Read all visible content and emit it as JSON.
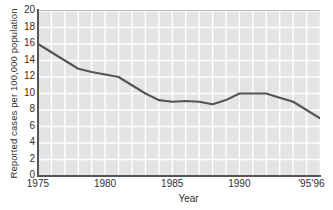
{
  "chart_data": {
    "type": "line",
    "title": "",
    "xlabel": "Year",
    "ylabel": "Reported cases per 100,000 population",
    "xlim": [
      1975,
      1996
    ],
    "ylim": [
      0,
      20
    ],
    "ytick_values": [
      0,
      2,
      4,
      6,
      8,
      10,
      12,
      14,
      16,
      18,
      20
    ],
    "ytick_labels": [
      "0",
      "2",
      "4",
      "6",
      "8",
      "10",
      "12",
      "14",
      "16",
      "18",
      "20"
    ],
    "xtick_values": [
      1975,
      1980,
      1985,
      1990,
      1995,
      1996
    ],
    "xtick_labels": [
      "1975",
      "1980",
      "1985",
      "1990",
      "'95",
      "'96"
    ],
    "grid": true,
    "grid_color": "#ffffff",
    "plot_background": "#e4e4e4",
    "line_color": "#555555",
    "legend": null,
    "x": [
      1975,
      1976,
      1977,
      1978,
      1979,
      1980,
      1981,
      1982,
      1983,
      1984,
      1985,
      1986,
      1987,
      1988,
      1989,
      1990,
      1991,
      1992,
      1993,
      1994,
      1995,
      1996
    ],
    "values": [
      16.0,
      15.0,
      14.0,
      13.0,
      12.6,
      12.3,
      12.0,
      11.0,
      10.0,
      9.2,
      9.0,
      9.1,
      9.0,
      8.7,
      9.2,
      10.0,
      10.0,
      10.0,
      9.5,
      9.0,
      8.0,
      7.0
    ],
    "series": [
      {
        "name": "Reported cases per 100,000 population",
        "values": [
          16.0,
          15.0,
          14.0,
          13.0,
          12.6,
          12.3,
          12.0,
          11.0,
          10.0,
          9.2,
          9.0,
          9.1,
          9.0,
          8.7,
          9.2,
          10.0,
          10.0,
          10.0,
          9.5,
          9.0,
          8.0,
          7.0
        ]
      }
    ]
  }
}
